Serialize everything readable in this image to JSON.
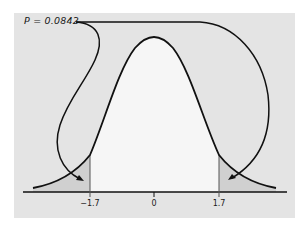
{
  "figure": {
    "annotation": "P = 0.0842",
    "axis": {
      "ticks": [
        {
          "label": "−1.7",
          "x": 90
        },
        {
          "label": "0",
          "x": 154
        },
        {
          "label": "1.7",
          "x": 219
        }
      ]
    },
    "colors": {
      "background": "#e4e4e4",
      "central_region": "#f5f5f5",
      "tail_region": "#d2d2d2",
      "curve": "#111111"
    }
  }
}
